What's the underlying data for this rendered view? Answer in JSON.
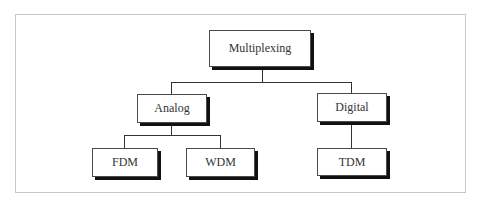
{
  "diagram": {
    "type": "tree",
    "root": {
      "label": "Multiplexing",
      "children": [
        {
          "label": "Analog",
          "children": [
            {
              "label": "FDM"
            },
            {
              "label": "WDM"
            }
          ]
        },
        {
          "label": "Digital",
          "children": [
            {
              "label": "TDM"
            }
          ]
        }
      ]
    }
  },
  "nodes": {
    "multiplexing": "Multiplexing",
    "analog": "Analog",
    "digital": "Digital",
    "fdm": "FDM",
    "wdm": "WDM",
    "tdm": "TDM"
  },
  "colors": {
    "border": "#4a4a4a",
    "shadow": "#111111",
    "frame": "#c8c8c8",
    "text": "#333333"
  }
}
